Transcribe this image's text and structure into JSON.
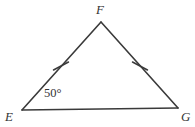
{
  "figure": {
    "kind": "geometry-diagram",
    "shape": "triangle",
    "name": "Triangle EFG",
    "background_color": "#ffffff",
    "stroke_color": "#3a3a3a",
    "text_color": "#343434",
    "stroke_width": 1.6
  },
  "vertices": [
    {
      "id": "F",
      "label": "F",
      "x": 101,
      "y": 22,
      "label_x": 96,
      "label_y": 3
    },
    {
      "id": "E",
      "label": "E",
      "x": 22,
      "y": 110,
      "label_x": 5,
      "label_y": 110
    },
    {
      "id": "G",
      "label": "G",
      "x": 178,
      "y": 108,
      "label_x": 181,
      "label_y": 110
    }
  ],
  "sides": [
    {
      "id": "EF",
      "from": "E",
      "to": "F",
      "tick_marks": 1
    },
    {
      "id": "FG",
      "from": "F",
      "to": "G",
      "tick_marks": 1
    },
    {
      "id": "EG",
      "from": "E",
      "to": "G",
      "tick_marks": 0
    }
  ],
  "tick_marks": [
    {
      "id": "tick-EF",
      "side": "EF",
      "center_x": 61,
      "center_y": 66,
      "angle_deg": 28,
      "length": 17
    },
    {
      "id": "tick-FG",
      "side": "FG",
      "center_x": 140,
      "center_y": 66,
      "angle_deg": -28,
      "length": 17
    }
  ],
  "angles": [
    {
      "id": "angle-E",
      "vertex": "E",
      "value": 50,
      "unit": "degrees",
      "label": "50°",
      "label_x": 44,
      "label_y": 87
    }
  ]
}
